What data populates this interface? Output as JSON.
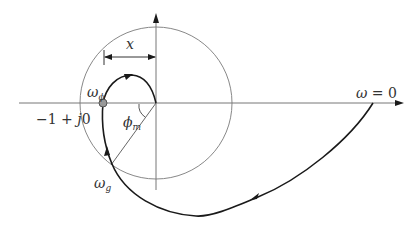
{
  "diagram": {
    "colors": {
      "axis": "#777777",
      "circle": "#888888",
      "curve": "#1a1a1a",
      "marker_fill": "#999999",
      "marker_stroke": "#555555",
      "label": "#333333"
    },
    "labels": {
      "distance": "x",
      "phase_crossover": "ω",
      "phase_crossover_sub": "ϕ",
      "critical_point_minus": "−1 + ",
      "critical_point_j": "j",
      "critical_point_zero": "0",
      "phase_margin": "ϕ",
      "phase_margin_sub": "m",
      "gain_crossover": "ω",
      "gain_crossover_sub": "g",
      "omega_zero_symbol": "ω",
      "omega_zero_rest": " = 0"
    },
    "elements": {
      "real_axis": "horizontal axis with arrow to the right",
      "imag_axis": "vertical axis with arrow upward",
      "unit_circle": "unit circle centered at origin",
      "nyquist_curve": "frequency response curve from ω = 0 spiralling toward origin",
      "critical_point": "marker at −1 + j0 crossing"
    }
  }
}
